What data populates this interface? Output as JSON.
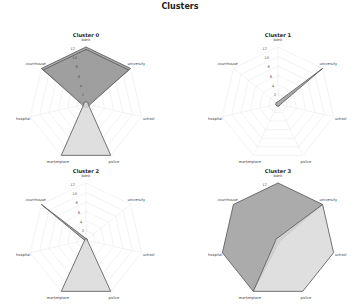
{
  "title": "Clusters",
  "colors": {
    "dark_fill": "#9c9c9c",
    "light_fill": "#d9d9d9",
    "edge": "#555555",
    "grid": "#e6e6e6"
  },
  "chart_data": [
    {
      "type": "radar",
      "title": "Cluster 0",
      "axes": [
        "bank",
        "university",
        "school",
        "police",
        "marketplace",
        "hospital",
        "courthouse"
      ],
      "rticks": [
        2,
        4,
        6,
        8,
        10,
        12
      ],
      "rlim": [
        0,
        12
      ],
      "series": [
        {
          "name": "s1",
          "values": [
            12,
            12,
            0.5,
            0.5,
            0.5,
            0.5,
            12
          ],
          "fill": "dark"
        },
        {
          "name": "s2",
          "values": [
            11.5,
            11.5,
            0.8,
            0.8,
            0.8,
            0.8,
            11.5
          ],
          "fill": "dark"
        },
        {
          "name": "s3",
          "values": [
            0.5,
            0.5,
            0.5,
            12,
            12,
            0.5,
            0.5
          ],
          "fill": "light"
        }
      ]
    },
    {
      "type": "radar",
      "title": "Cluster 1",
      "axes": [
        "bank",
        "university",
        "school",
        "police",
        "marketplace",
        "hospital",
        "courthouse"
      ],
      "rticks": [
        2,
        4,
        6,
        8,
        10,
        12
      ],
      "rlim": [
        0,
        12
      ],
      "series": [
        {
          "name": "s1",
          "values": [
            0.5,
            12,
            0.5,
            0.5,
            0.5,
            0.5,
            0.5
          ],
          "fill": "dark"
        }
      ]
    },
    {
      "type": "radar",
      "title": "Cluster 2",
      "axes": [
        "bank",
        "university",
        "school",
        "police",
        "marketplace",
        "hospital",
        "courthouse"
      ],
      "rticks": [
        2,
        4,
        6,
        8,
        10,
        12
      ],
      "rlim": [
        0,
        12
      ],
      "series": [
        {
          "name": "s1",
          "values": [
            0.3,
            0.3,
            0.3,
            0.3,
            0.3,
            0.3,
            12
          ],
          "fill": "dark"
        },
        {
          "name": "s2",
          "values": [
            0.3,
            0.3,
            0.3,
            12,
            12,
            0.3,
            0.3
          ],
          "fill": "light"
        }
      ]
    },
    {
      "type": "radar",
      "title": "Cluster 3",
      "axes": [
        "bank",
        "university",
        "school",
        "police",
        "marketplace",
        "hospital",
        "courthouse"
      ],
      "rticks": [
        12
      ],
      "rlim": [
        0,
        12
      ],
      "series": [
        {
          "name": "s1",
          "values": [
            12,
            12,
            0.5,
            0.5,
            12,
            12,
            12
          ],
          "fill": "dark"
        },
        {
          "name": "s2",
          "values": [
            0.5,
            12,
            12,
            12,
            12,
            0.5,
            0.5
          ],
          "fill": "light"
        }
      ]
    }
  ]
}
